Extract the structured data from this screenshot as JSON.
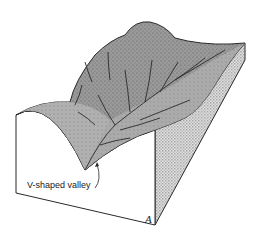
{
  "diagram": {
    "type": "block-diagram",
    "labels": {
      "valley": "V-shaped valley",
      "corner": "A"
    },
    "colors": {
      "line": "#2a2a2a",
      "surface": "#8c8c8c",
      "surface_light": "#b4b4b4",
      "side_hatch": "#c8c8c8",
      "front": "#ffffff"
    }
  }
}
